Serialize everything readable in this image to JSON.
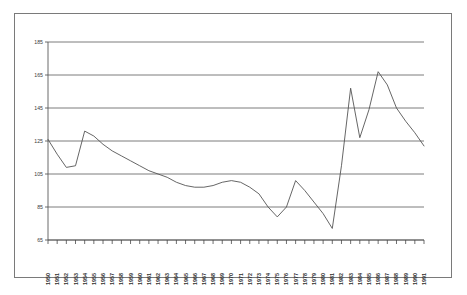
{
  "chart_data": {
    "type": "line",
    "title": "",
    "subtitle": "",
    "xlabel": "",
    "ylabel": "",
    "grid": true,
    "legend": null,
    "xlim": [
      1950,
      1991
    ],
    "ylim": [
      65,
      185
    ],
    "yticks": [
      65,
      85,
      105,
      125,
      145,
      165,
      185
    ],
    "ytick_labels": [
      "65",
      "85",
      "105",
      "125",
      "145",
      "165",
      "185"
    ],
    "categories": [
      "1950",
      "1951",
      "1952",
      "1953",
      "1954",
      "1955",
      "1956",
      "1957",
      "1958",
      "1959",
      "1960",
      "1961",
      "1962",
      "1963",
      "1964",
      "1965",
      "1966",
      "1967",
      "1968",
      "1969",
      "1970",
      "1971",
      "1972",
      "1973",
      "1974",
      "1975",
      "1976",
      "1977",
      "1978",
      "1979",
      "1980",
      "1981",
      "1982",
      "1983",
      "1984",
      "1985",
      "1986",
      "1987",
      "1988",
      "1989",
      "1990",
      "1991"
    ],
    "values": [
      126,
      117,
      109,
      110,
      131,
      128,
      123,
      119,
      116,
      113,
      110,
      107,
      105,
      103,
      100,
      98,
      97,
      97,
      98,
      100,
      101,
      100,
      97,
      93,
      85,
      79,
      85,
      101,
      95,
      88,
      81,
      72,
      110,
      157,
      127,
      144,
      167,
      159,
      145,
      137,
      130,
      122
    ],
    "series": [
      {
        "name": "series-1",
        "color": "#555555",
        "values": [
          126,
          117,
          109,
          110,
          131,
          128,
          123,
          119,
          116,
          113,
          110,
          107,
          105,
          103,
          100,
          98,
          97,
          97,
          98,
          100,
          101,
          100,
          97,
          93,
          85,
          79,
          85,
          101,
          95,
          88,
          81,
          72,
          110,
          157,
          127,
          144,
          167,
          159,
          145,
          137,
          130,
          122
        ]
      }
    ]
  },
  "figure": {
    "border_color": "#7a7a7a",
    "background": "#ffffff",
    "grid_color": "#5a5a5a",
    "line_color": "#555555"
  }
}
